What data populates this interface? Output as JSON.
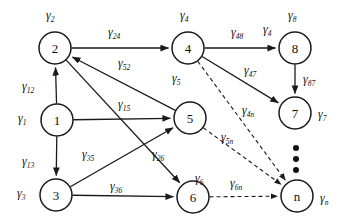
{
  "diagram": {
    "width": 347,
    "height": 223,
    "colors": {
      "stroke": "#1a1a1a",
      "fill": "#ffffff",
      "text": "#111111"
    },
    "nodes": [
      {
        "id": "n1",
        "label": "1",
        "cx": 57,
        "cy": 120,
        "r": 16
      },
      {
        "id": "n2",
        "label": "2",
        "cx": 55,
        "cy": 48,
        "r": 16
      },
      {
        "id": "n3",
        "label": "3",
        "cx": 56,
        "cy": 195,
        "r": 16
      },
      {
        "id": "n4",
        "label": "4",
        "cx": 188,
        "cy": 48,
        "r": 16
      },
      {
        "id": "n5",
        "label": "5",
        "cx": 190,
        "cy": 118,
        "r": 16
      },
      {
        "id": "n6",
        "label": "6",
        "cx": 193,
        "cy": 197,
        "r": 16
      },
      {
        "id": "n7",
        "label": "7",
        "cx": 295,
        "cy": 113,
        "r": 16
      },
      {
        "id": "n8",
        "label": "8",
        "cx": 295,
        "cy": 48,
        "r": 16
      },
      {
        "id": "nn",
        "label": "n",
        "cx": 297,
        "cy": 196,
        "r": 16
      }
    ],
    "node_rate_labels": [
      {
        "id": "rate-1",
        "base": "γ",
        "sub": "1",
        "x": 18,
        "y": 112
      },
      {
        "id": "rate-2",
        "base": "γ",
        "sub": "2",
        "x": 46,
        "y": 9
      },
      {
        "id": "rate-3",
        "base": "γ",
        "sub": "3",
        "x": 17,
        "y": 187
      },
      {
        "id": "rate-4",
        "base": "γ",
        "sub": "4",
        "x": 180,
        "y": 9
      },
      {
        "id": "rate-5",
        "base": "γ",
        "sub": "5",
        "x": 172,
        "y": 72
      },
      {
        "id": "rate-6",
        "base": "γ",
        "sub": "6",
        "x": 195,
        "y": 172
      },
      {
        "id": "rate-7",
        "base": "γ",
        "sub": "7",
        "x": 318,
        "y": 108
      },
      {
        "id": "rate-8",
        "base": "γ",
        "sub": "8",
        "x": 288,
        "y": 9
      },
      {
        "id": "rate-4b",
        "base": "γ",
        "sub": "4",
        "x": 263,
        "y": 23
      },
      {
        "id": "rate-n",
        "base": "γ",
        "sub": "n",
        "x": 320,
        "y": 192
      }
    ],
    "edges": [
      {
        "id": "e-1-2",
        "from": "n1",
        "to": "n2",
        "style": "solid",
        "label": "γ",
        "sub": "12",
        "lx": 22,
        "ly": 80
      },
      {
        "id": "e-1-3",
        "from": "n1",
        "to": "n3",
        "style": "solid",
        "label": "γ",
        "sub": "13",
        "lx": 22,
        "ly": 155
      },
      {
        "id": "e-1-5",
        "from": "n1",
        "to": "n5",
        "style": "solid",
        "label": "γ",
        "sub": "15",
        "lx": 118,
        "ly": 98
      },
      {
        "id": "e-2-4",
        "from": "n2",
        "to": "n4",
        "style": "solid",
        "label": "γ",
        "sub": "24",
        "lx": 108,
        "ly": 26
      },
      {
        "id": "e-2-6",
        "from": "n2",
        "to": "n6",
        "style": "solid",
        "label": "γ",
        "sub": "26",
        "lx": 152,
        "ly": 148
      },
      {
        "id": "e-3-5",
        "from": "n3",
        "to": "n5",
        "style": "solid",
        "label": "γ",
        "sub": "35",
        "lx": 82,
        "ly": 148
      },
      {
        "id": "e-3-6",
        "from": "n3",
        "to": "n6",
        "style": "solid",
        "label": "γ",
        "sub": "36",
        "lx": 110,
        "ly": 180
      },
      {
        "id": "e-5-2",
        "from": "n5",
        "to": "n2",
        "style": "solid",
        "label": "γ",
        "sub": "52",
        "lx": 118,
        "ly": 57
      },
      {
        "id": "e-4-8",
        "from": "n4",
        "to": "n8",
        "style": "solid",
        "label": "γ",
        "sub": "48",
        "lx": 231,
        "ly": 26
      },
      {
        "id": "e-4-7",
        "from": "n4",
        "to": "n7",
        "style": "solid",
        "label": "γ",
        "sub": "47",
        "lx": 244,
        "ly": 64
      },
      {
        "id": "e-8-7",
        "from": "n8",
        "to": "n7",
        "style": "solid",
        "label": "γ",
        "sub": "87",
        "lx": 303,
        "ly": 73
      },
      {
        "id": "e-4-n",
        "from": "n4",
        "to": "nn",
        "style": "dashed",
        "label": "γ",
        "sub": "4n",
        "lx": 242,
        "ly": 104
      },
      {
        "id": "e-5-n",
        "from": "n5",
        "to": "nn",
        "style": "dashed",
        "label": "γ",
        "sub": "5n",
        "lx": 221,
        "ly": 131
      },
      {
        "id": "e-6-n",
        "from": "n6",
        "to": "nn",
        "style": "dashed",
        "label": "γ",
        "sub": "6n",
        "lx": 230,
        "ly": 177
      }
    ],
    "ellipsis_dots": [
      {
        "x": 293,
        "y": 145
      },
      {
        "x": 293,
        "y": 156
      },
      {
        "x": 293,
        "y": 167
      }
    ]
  }
}
